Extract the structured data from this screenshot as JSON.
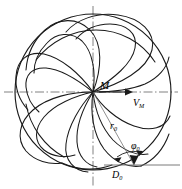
{
  "figure": {
    "type": "schematic-diagram",
    "width": 182,
    "height": 189,
    "background_color": "#ffffff",
    "line_color": "#1a1a1a",
    "axis_color": "#555555"
  },
  "labels": {
    "center_point": "M",
    "velocity_vector": "V",
    "velocity_vector_sub": "M",
    "radius": "r",
    "radius_sub": "0",
    "angle": "φ",
    "angle_sub": "0",
    "diameter": "D",
    "diameter_sub": "0"
  },
  "geometry": {
    "circle_center_x": 93,
    "circle_center_y": 92,
    "circle_radius": 78,
    "convergence_point_x": 93,
    "convergence_point_y": 92,
    "blade_count": 8,
    "inner_radius_r0": 52,
    "angle_phi0_degrees": 38
  },
  "axes": {
    "horizontal_style": "dash-dot",
    "vertical_style": "dash-dot",
    "horizontal_y": 92,
    "vertical_x": 93
  },
  "annotations": {
    "velocity_arrow": "arrow pointing right from M",
    "radius_line": "line from M down-right to circle",
    "angle_arc": "arc between r0 line and horizontal D0 line",
    "diameter_line": "horizontal reference line at bottom right"
  }
}
